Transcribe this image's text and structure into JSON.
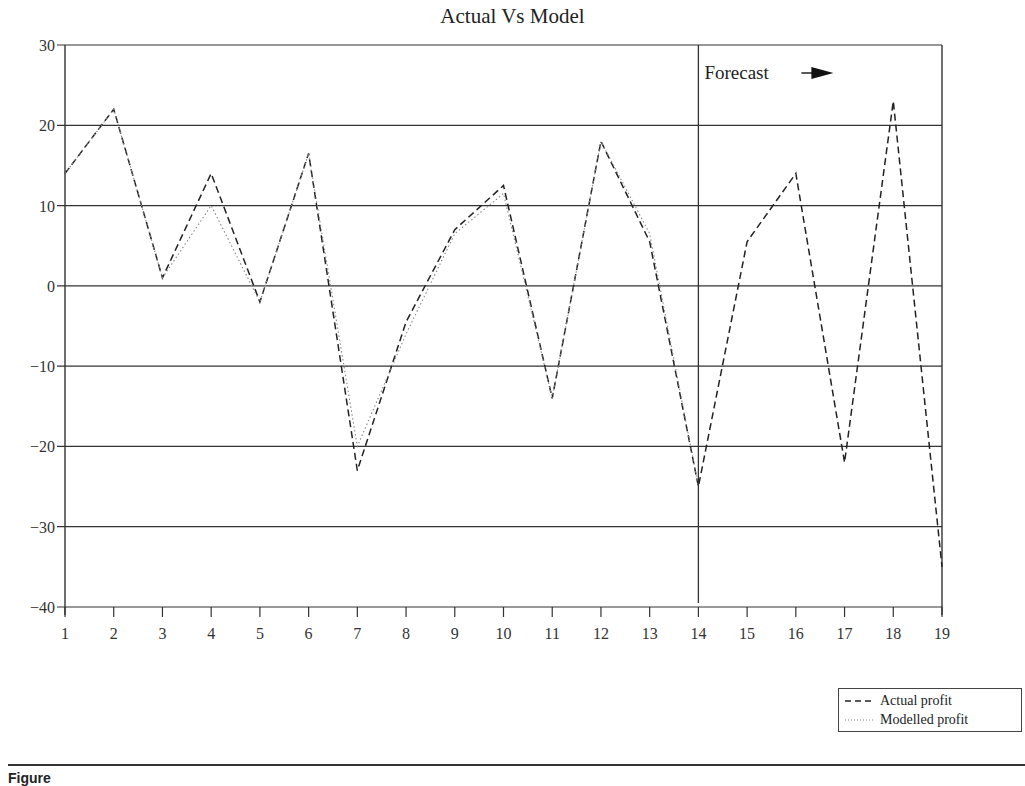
{
  "chart_data": {
    "type": "line",
    "title": "Actual Vs Model",
    "xlabel": "",
    "ylabel": "",
    "x": [
      1,
      2,
      3,
      4,
      5,
      6,
      7,
      8,
      9,
      10,
      11,
      12,
      13,
      14,
      15,
      16,
      17,
      18,
      19
    ],
    "xlim": [
      1,
      19
    ],
    "ylim": [
      -40,
      30
    ],
    "yticks": [
      30,
      20,
      10,
      0,
      -10,
      -20,
      -30,
      -40
    ],
    "grid": "horizontal",
    "series": [
      {
        "name": "Actual profit",
        "style": "dashed",
        "values": [
          14,
          22,
          1,
          14,
          -2,
          16.5,
          -23,
          -4.5,
          7,
          12.5,
          -14,
          18,
          5.5,
          -25,
          5.5,
          14,
          -22,
          23,
          -35
        ]
      },
      {
        "name": "Modelled profit",
        "style": "dotted",
        "values": [
          14,
          22,
          1,
          10,
          -2,
          16.5,
          -20,
          -6,
          6.5,
          11.5,
          -14,
          18,
          6.5,
          -25,
          null,
          null,
          null,
          null,
          null
        ]
      }
    ],
    "annotations": [
      {
        "text": "Forecast",
        "x": 14,
        "type": "vertical-line-with-arrow"
      }
    ],
    "legend_position": "bottom-right"
  },
  "title": "Actual Vs Model",
  "forecast_label": "Forecast",
  "legend": {
    "items": [
      {
        "label": "Actual profit",
        "style": "dashed"
      },
      {
        "label": "Modelled profit",
        "style": "dotted"
      }
    ]
  },
  "caption": "Figure"
}
